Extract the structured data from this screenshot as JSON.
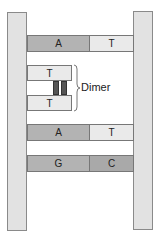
{
  "diagram": {
    "type": "dna-thymine-dimer",
    "rows": [
      {
        "left": "A",
        "right": "T"
      },
      {
        "dimer": [
          "T",
          "T"
        ]
      },
      {
        "left": "A",
        "right": "T"
      },
      {
        "left": "G",
        "right": "C"
      }
    ],
    "labels": {
      "row1_left": "A",
      "row1_right": "T",
      "dimer_top": "T",
      "dimer_bottom": "T",
      "dimer_label": "Dimer",
      "row3_left": "A",
      "row3_right": "T",
      "row4_left": "G",
      "row4_right": "C"
    },
    "colors": {
      "backbone": "#e2e2e2",
      "base_dark": "#b3b3b3",
      "base_light": "#eaeaea",
      "bond": "#555555"
    }
  }
}
